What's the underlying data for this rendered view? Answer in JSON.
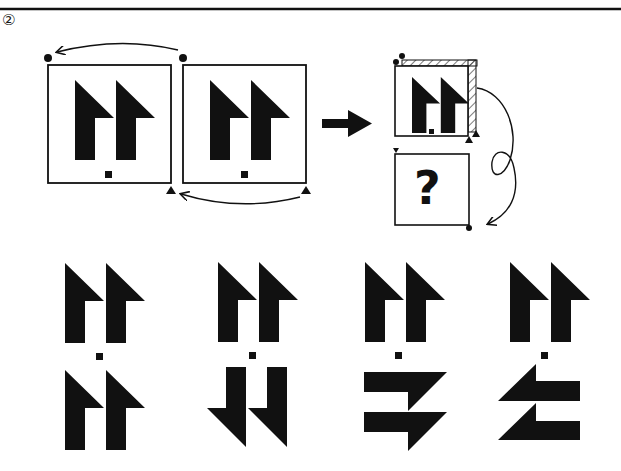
{
  "problem": {
    "number_label": "②",
    "ink_color": "#111111",
    "background": "#ffffff"
  },
  "example": {
    "description": "Two identical panels; each shows two up-pointing half-arrows with a small square below. Curved arrows indicate the top-left dot corner maps to the top-right corner, and bottom triangles map across (a horizontal flip).",
    "panel_count": 2,
    "markers": [
      "dot-top-left",
      "dot-top-right",
      "triangle-bottom-right",
      "triangle-bottom-left"
    ],
    "transform_arrow": "right-arrow"
  },
  "question": {
    "description": "Folded panel with hatched top and right edges, a loop arrow pointing to a second panel containing a question mark.",
    "unknown_symbol": "?",
    "fold_edges": [
      "top",
      "right"
    ]
  },
  "options": [
    {
      "id": "1",
      "top": "two up half-arrows",
      "bottom": "two up half-arrows"
    },
    {
      "id": "2",
      "top": "two up half-arrows",
      "bottom": "two down half-arrows"
    },
    {
      "id": "3",
      "top": "two up half-arrows",
      "bottom": "two right half-arrows"
    },
    {
      "id": "4",
      "top": "two up half-arrows",
      "bottom": "two left half-arrows"
    }
  ]
}
